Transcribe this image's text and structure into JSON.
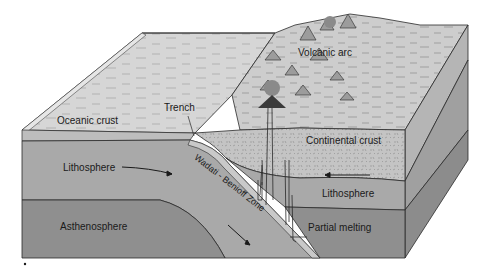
{
  "diagram": {
    "type": "block-diagram",
    "labels": {
      "volcanic_arc": "Volcanic arc",
      "trench": "Trench",
      "oceanic_crust": "Oceanic crust",
      "continental_crust": "Continental crust",
      "lithosphere_left": "Lithosphere",
      "lithosphere_right": "Lithosphere",
      "wadati_benioff_zone": "Wadati - Benioff Zone",
      "asthenosphere": "Asthenosphere",
      "partial_melting": "Partial melting"
    },
    "colors": {
      "ocean_surface": "#d6d6d6",
      "oceanic_crust": "#bdbdbd",
      "lithosphere": "#a9a9a9",
      "asthenosphere": "#8e8e8e",
      "continental_crust": "#c4c4c4",
      "land_surface": "#cfcfcf",
      "side_face": "#9a9a9a",
      "line": "#2a2a2a"
    }
  }
}
